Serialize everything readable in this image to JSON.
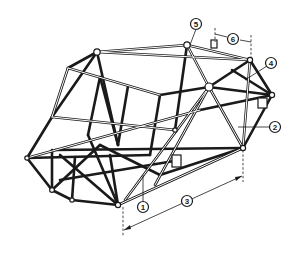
{
  "diagram": {
    "colors": {
      "background": "#ffffff",
      "ink": "#1a1a1a"
    },
    "callouts": [
      {
        "id": "1",
        "label": "1",
        "cx": 143,
        "cy": 207
      },
      {
        "id": "2",
        "label": "2",
        "cx": 275,
        "cy": 127
      },
      {
        "id": "3",
        "label": "3",
        "cx": 187,
        "cy": 201
      },
      {
        "id": "4",
        "label": "4",
        "cx": 271,
        "cy": 63
      },
      {
        "id": "5",
        "label": "5",
        "cx": 196,
        "cy": 24
      },
      {
        "id": "6",
        "label": "6",
        "cx": 233,
        "cy": 39
      }
    ],
    "dimensions": [
      {
        "callout": "3",
        "description": "frame length dimension line along bottom right side"
      },
      {
        "callout": "6",
        "description": "short dimension at rear top"
      }
    ]
  }
}
